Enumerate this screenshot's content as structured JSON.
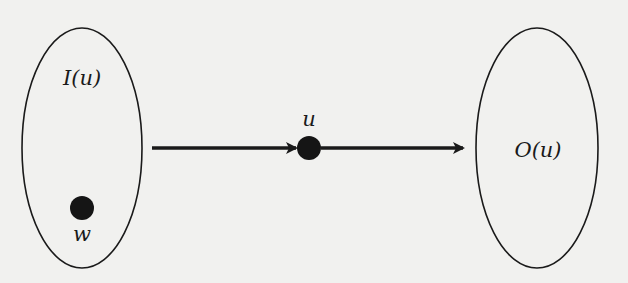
{
  "diagram": {
    "type": "directed-graph-schematic",
    "colors": {
      "background": "#f1f1ef",
      "stroke": "#1a1a1a",
      "node_fill": "#151515"
    },
    "sets": [
      {
        "id": "in-set",
        "label": "I(u)"
      },
      {
        "id": "out-set",
        "label": "O(u)"
      }
    ],
    "nodes": [
      {
        "id": "w",
        "label": "w",
        "in_set": "I(u)"
      },
      {
        "id": "u",
        "label": "u"
      }
    ],
    "edges": [
      {
        "from": "I(u)",
        "to": "u"
      },
      {
        "from": "u",
        "to": "O(u)"
      }
    ]
  }
}
